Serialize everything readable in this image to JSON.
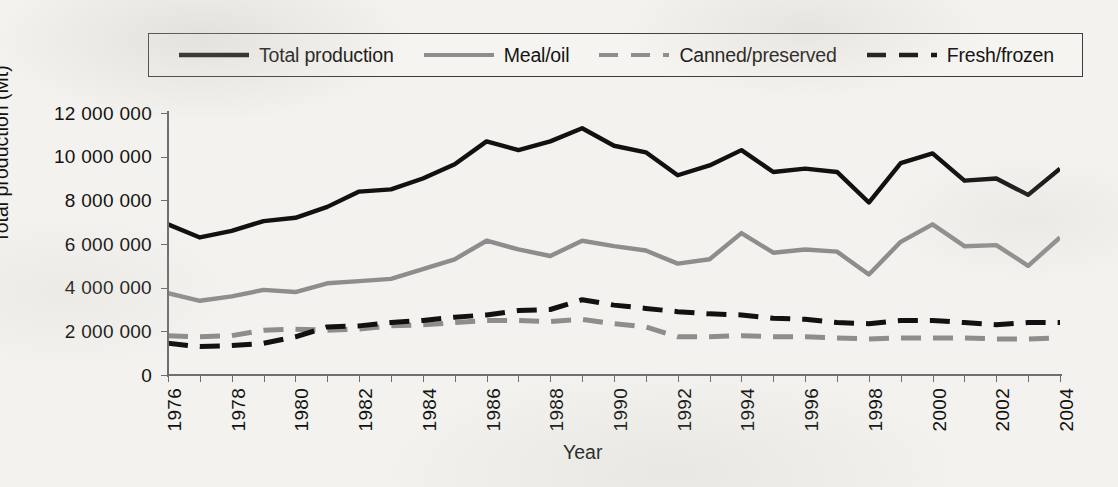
{
  "legend": {
    "position": "top",
    "entries": [
      {
        "label": "Total production",
        "style": "solid",
        "color": "#111111",
        "width": 4.6,
        "icon": "line-swatch-solid-black"
      },
      {
        "label": "Meal/oil",
        "style": "solid",
        "color": "#8d8d8d",
        "width": 4.2,
        "icon": "line-swatch-solid-gray"
      },
      {
        "label": "Canned/preserved",
        "style": "dashed",
        "color": "#8d8d8d",
        "width": 4.2,
        "icon": "line-swatch-dashed-gray"
      },
      {
        "label": "Fresh/frozen",
        "style": "dashed",
        "color": "#111111",
        "width": 4.6,
        "icon": "line-swatch-dashed-black"
      }
    ]
  },
  "axes": {
    "ylabel": "Total production (Mt)",
    "xlabel": "Year",
    "yticks": [
      "0",
      "2 000 000",
      "4 000 000",
      "6 000 000",
      "8 000 000",
      "10 000 000",
      "12 000 000"
    ],
    "ytick_values": [
      0,
      2000000,
      4000000,
      6000000,
      8000000,
      10000000,
      12000000
    ],
    "xticks": [
      "1976",
      "1978",
      "1980",
      "1982",
      "1984",
      "1986",
      "1988",
      "1990",
      "1992",
      "1994",
      "1996",
      "1998",
      "2000",
      "2002",
      "2004"
    ]
  },
  "chart_data": {
    "type": "line",
    "title": "",
    "xlabel": "Year",
    "ylabel": "Total production (Mt)",
    "xlim": [
      1976,
      2004
    ],
    "ylim": [
      0,
      12000000
    ],
    "grid": false,
    "legend_position": "top",
    "x": [
      1976,
      1977,
      1978,
      1979,
      1980,
      1981,
      1982,
      1983,
      1984,
      1985,
      1986,
      1987,
      1988,
      1989,
      1990,
      1991,
      1992,
      1993,
      1994,
      1995,
      1996,
      1997,
      1998,
      1999,
      2000,
      2001,
      2002,
      2003,
      2004
    ],
    "series": [
      {
        "name": "Total production",
        "style": "solid",
        "color": "#111111",
        "values": [
          6900000,
          6300000,
          6600000,
          7050000,
          7200000,
          7700000,
          8400000,
          8500000,
          9000000,
          9650000,
          10700000,
          10300000,
          10700000,
          11300000,
          10500000,
          10200000,
          9150000,
          9600000,
          10300000,
          9300000,
          9450000,
          9300000,
          7900000,
          9700000,
          10150000,
          8900000,
          9000000,
          8250000,
          9450000
        ]
      },
      {
        "name": "Meal/oil",
        "style": "solid",
        "color": "#8d8d8d",
        "values": [
          3750000,
          3400000,
          3600000,
          3900000,
          3800000,
          4200000,
          4300000,
          4400000,
          4850000,
          5300000,
          6150000,
          5750000,
          5450000,
          6150000,
          5900000,
          5700000,
          5100000,
          5300000,
          6500000,
          5600000,
          5750000,
          5650000,
          4600000,
          6100000,
          6900000,
          5900000,
          5950000,
          5000000,
          6300000
        ]
      },
      {
        "name": "Canned/preserved",
        "style": "dashed",
        "color": "#8d8d8d",
        "values": [
          1800000,
          1750000,
          1800000,
          2050000,
          2100000,
          2050000,
          2100000,
          2250000,
          2300000,
          2400000,
          2500000,
          2500000,
          2450000,
          2550000,
          2350000,
          2200000,
          1750000,
          1750000,
          1800000,
          1750000,
          1750000,
          1700000,
          1650000,
          1700000,
          1700000,
          1700000,
          1650000,
          1650000,
          1700000
        ]
      },
      {
        "name": "Fresh/frozen",
        "style": "dashed",
        "color": "#111111",
        "values": [
          1450000,
          1300000,
          1350000,
          1450000,
          1750000,
          2200000,
          2250000,
          2400000,
          2500000,
          2650000,
          2750000,
          2950000,
          3000000,
          3450000,
          3200000,
          3050000,
          2900000,
          2800000,
          2750000,
          2600000,
          2550000,
          2400000,
          2350000,
          2500000,
          2500000,
          2400000,
          2300000,
          2400000,
          2400000
        ]
      }
    ]
  }
}
